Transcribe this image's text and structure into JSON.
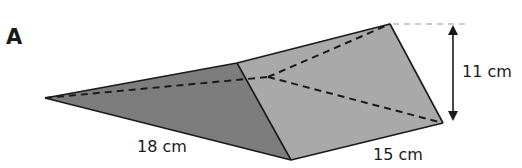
{
  "figure": {
    "letter": "A",
    "shape": "triangular prism",
    "labels": {
      "length": "18 cm",
      "width": "15 cm",
      "height": "11 cm"
    }
  },
  "colors": {
    "dark_face": "#7d7d7d",
    "light_face": "#a9a9a9",
    "edge": "#1a1a1a",
    "guide_line": "#9a9a9a",
    "text": "#1a1a1a"
  }
}
